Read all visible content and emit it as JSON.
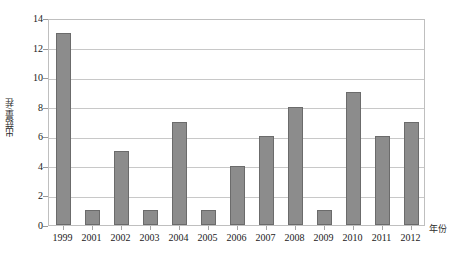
{
  "top_caption": "",
  "chart_data": {
    "type": "bar",
    "title": "",
    "subtitle": "",
    "xlabel": "年份",
    "ylabel": "出菇量/茬",
    "categories": [
      "1999",
      "2001",
      "2002",
      "2003",
      "2004",
      "2005",
      "2006",
      "2007",
      "2008",
      "2009",
      "2010",
      "2011",
      "2012"
    ],
    "values": [
      13,
      1,
      5,
      1,
      7,
      1,
      4,
      6,
      8,
      1,
      9,
      6,
      7
    ],
    "ylim": [
      0,
      14
    ],
    "ytick_values": [
      0,
      2,
      4,
      6,
      8,
      10,
      12,
      14
    ],
    "ytick_labels": [
      "0",
      "2",
      "4",
      "6",
      "8",
      "10",
      "12",
      "14"
    ],
    "grid": true,
    "grid_axis": "y",
    "legend": false,
    "legend_position": "none",
    "bar_color": "#8c8c8c",
    "bar_edge_color": "#6b6b6b",
    "grid_color": "#c8c8c8",
    "frame_color": "#bfbfbf",
    "text_color": "#1a1a1a",
    "background_color": "#ffffff"
  }
}
